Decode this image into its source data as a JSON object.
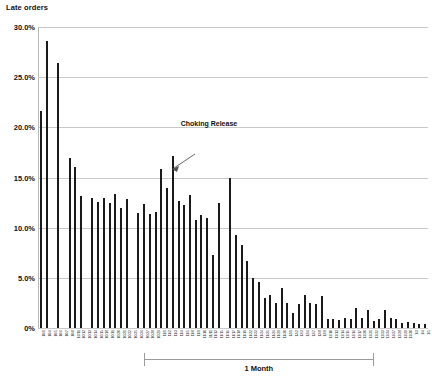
{
  "chart_data": {
    "type": "bar",
    "title": "Late orders",
    "xlabel": "",
    "ylabel": "",
    "ylim": [
      0,
      30
    ],
    "ytick_labels": [
      "30.0%",
      "25.0%",
      "20.0%",
      "15.0%",
      "10.0%",
      "5.0%",
      "0%"
    ],
    "ytick_values": [
      30,
      25,
      20,
      15,
      10,
      5,
      0
    ],
    "grid": true,
    "legend": null,
    "categories": [
      "10/1",
      "10/4",
      "10/5",
      "10/6",
      "10/7",
      "10/8",
      "10/11",
      "10/12",
      "10/13",
      "10/14",
      "10/15",
      "10/18",
      "10/19",
      "10/20",
      "10/21",
      "10/22",
      "10/25",
      "10/26",
      "10/27",
      "10/28",
      "10/29",
      "11/1",
      "11/2",
      "11/3",
      "11/4",
      "11/5",
      "11/8",
      "11/9",
      "11/10",
      "11/11",
      "11/12",
      "11/15",
      "11/16",
      "11/17",
      "11/18",
      "11/19",
      "11/22",
      "11/23",
      "11/24",
      "11/25",
      "11/26",
      "11/29",
      "11/30",
      "12/1",
      "12/2",
      "12/3",
      "12/6",
      "12/7",
      "12/8",
      "12/9",
      "12/10",
      "12/13",
      "12/14",
      "12/15",
      "12/16",
      "12/17",
      "12/20",
      "12/21",
      "12/22",
      "12/23",
      "12/24",
      "12/27",
      "12/28",
      "12/29",
      "12/30",
      "1/3",
      "1/4",
      "1/5"
    ],
    "values": [
      21.6,
      28.6,
      0.0,
      26.4,
      0.0,
      16.9,
      16.0,
      13.2,
      0.0,
      13.0,
      12.6,
      13.0,
      12.5,
      13.4,
      12.0,
      12.9,
      0.0,
      11.5,
      12.4,
      11.4,
      11.6,
      15.8,
      14.0,
      17.1,
      12.7,
      12.3,
      13.3,
      10.8,
      11.3,
      11.0,
      7.3,
      12.5,
      0.0,
      15.0,
      9.3,
      8.3,
      6.7,
      5.0,
      4.6,
      3.0,
      3.3,
      2.5,
      4.0,
      2.5,
      1.5,
      2.4,
      3.3,
      2.5,
      2.4,
      3.2,
      0.9,
      0.9,
      0.8,
      1.0,
      0.9,
      2.0,
      1.0,
      1.8,
      0.7,
      0.9,
      1.8,
      1.0,
      0.9,
      0.5,
      0.6,
      0.5,
      0.4,
      0.4
    ],
    "annotations": [
      {
        "name": "choking-release",
        "text": "Choking Release",
        "target_index": 23,
        "target_value": 17.1
      },
      {
        "name": "one-month-span",
        "text": "1 Month",
        "start_index": 18,
        "end_index": 58
      }
    ],
    "colors": {
      "bar": "#1a1a1a",
      "gridline": "#c9c9c9",
      "axis": "#b8b8b8",
      "text": "#111111",
      "annotation": "#9a9a9a"
    }
  }
}
